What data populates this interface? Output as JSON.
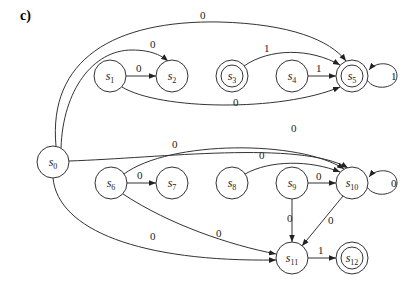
{
  "panel_label": "c)",
  "diagram": {
    "type": "state-machine",
    "nodes": [
      {
        "id": "s0",
        "label": "s",
        "sub": "0",
        "x": 53,
        "y": 162,
        "accepting": false
      },
      {
        "id": "s1",
        "label": "s",
        "sub": "1",
        "x": 110,
        "y": 76,
        "accepting": false
      },
      {
        "id": "s2",
        "label": "s",
        "sub": "2",
        "x": 172,
        "y": 76,
        "accepting": false
      },
      {
        "id": "s3",
        "label": "s",
        "sub": "3",
        "x": 232,
        "y": 76,
        "accepting": true
      },
      {
        "id": "s4",
        "label": "s",
        "sub": "4",
        "x": 292,
        "y": 76,
        "accepting": false
      },
      {
        "id": "s5",
        "label": "s",
        "sub": "5",
        "x": 352,
        "y": 76,
        "accepting": true
      },
      {
        "id": "s6",
        "label": "s",
        "sub": "6",
        "x": 111,
        "y": 183,
        "accepting": false
      },
      {
        "id": "s7",
        "label": "s",
        "sub": "7",
        "x": 172,
        "y": 183,
        "accepting": false
      },
      {
        "id": "s8",
        "label": "s",
        "sub": "8",
        "x": 232,
        "y": 183,
        "accepting": false
      },
      {
        "id": "s9",
        "label": "s",
        "sub": "9",
        "x": 292,
        "y": 183,
        "accepting": false
      },
      {
        "id": "s10",
        "label": "s",
        "sub": "10",
        "x": 352,
        "y": 183,
        "accepting": false
      },
      {
        "id": "s11",
        "label": "s",
        "sub": "11",
        "x": 292,
        "y": 258,
        "accepting": false
      },
      {
        "id": "s12",
        "label": "s",
        "sub": "12",
        "x": 352,
        "y": 258,
        "accepting": true
      }
    ],
    "edges": [
      {
        "from": "s0",
        "to": "s5",
        "label": "0"
      },
      {
        "from": "s0",
        "to": "s2",
        "label": "0"
      },
      {
        "from": "s1",
        "to": "s2",
        "label": "0"
      },
      {
        "from": "s1",
        "to": "s5",
        "label": "0"
      },
      {
        "from": "s3",
        "to": "s5",
        "label": "1"
      },
      {
        "from": "s4",
        "to": "s5",
        "label": "1"
      },
      {
        "from": "s5",
        "to": "s5",
        "label": "1"
      },
      {
        "from": "s0",
        "to": "s10",
        "label": "0"
      },
      {
        "from": "s6",
        "to": "s10",
        "label": "0"
      },
      {
        "from": "s6",
        "to": "s7",
        "label": "0"
      },
      {
        "from": "s8",
        "to": "s10",
        "label": "0"
      },
      {
        "from": "s9",
        "to": "s10",
        "label": "0"
      },
      {
        "from": "s10",
        "to": "s10",
        "label": "0"
      },
      {
        "from": "s9",
        "to": "s11",
        "label": "0"
      },
      {
        "from": "s10",
        "to": "s11",
        "label": "0"
      },
      {
        "from": "s6",
        "to": "s11",
        "label": "0"
      },
      {
        "from": "s0",
        "to": "s11",
        "label": "0"
      },
      {
        "from": "s11",
        "to": "s12",
        "label": "1"
      }
    ]
  }
}
